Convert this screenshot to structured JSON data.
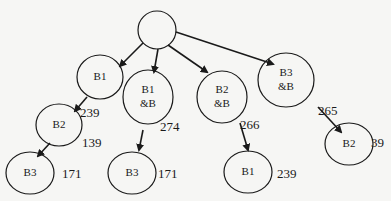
{
  "diagram": {
    "type": "tree",
    "colors": {
      "stroke": "#1a1a1a",
      "background": "#f6f6f4"
    },
    "nodes": [
      {
        "id": "root",
        "label": "",
        "cx": 157,
        "cy": 30,
        "rx": 19,
        "ry": 19
      },
      {
        "id": "b1",
        "label": "B1",
        "cx": 100,
        "cy": 77,
        "rx": 23,
        "ry": 22
      },
      {
        "id": "b1b",
        "label": "B1",
        "label2": "&B",
        "cx": 148,
        "cy": 97,
        "rx": 25,
        "ry": 27
      },
      {
        "id": "b2b",
        "label": "B2",
        "label2": "&B",
        "cx": 222,
        "cy": 97,
        "rx": 25,
        "ry": 26
      },
      {
        "id": "b3b",
        "label": "B3",
        "label2": "&B",
        "cx": 286,
        "cy": 80,
        "rx": 28,
        "ry": 27
      },
      {
        "id": "b2l",
        "label": "B2",
        "cx": 59,
        "cy": 125,
        "rx": 23,
        "ry": 21
      },
      {
        "id": "b3l",
        "label": "B3",
        "cx": 30,
        "cy": 173,
        "rx": 24,
        "ry": 21
      },
      {
        "id": "b3m",
        "label": "B3",
        "cx": 132,
        "cy": 173,
        "rx": 24,
        "ry": 21
      },
      {
        "id": "b1r",
        "label": "B1",
        "cx": 248,
        "cy": 172,
        "rx": 24,
        "ry": 21
      },
      {
        "id": "b2r",
        "label": "B2",
        "cx": 349,
        "cy": 144,
        "rx": 24,
        "ry": 21
      }
    ],
    "edges": [
      {
        "from": "root",
        "to": "b1",
        "x1": 143,
        "y1": 43,
        "x2": 120,
        "y2": 66
      },
      {
        "from": "root",
        "to": "b1b",
        "x1": 158,
        "y1": 49,
        "x2": 154,
        "y2": 72
      },
      {
        "from": "root",
        "to": "b2b",
        "x1": 168,
        "y1": 45,
        "x2": 207,
        "y2": 72
      },
      {
        "from": "root",
        "to": "b3b",
        "x1": 176,
        "y1": 32,
        "x2": 273,
        "y2": 64
      },
      {
        "from": "b1",
        "to": "b2l",
        "x1": 87,
        "y1": 97,
        "x2": 75,
        "y2": 111
      },
      {
        "from": "b2l",
        "to": "b3l",
        "x1": 50,
        "y1": 143,
        "x2": 38,
        "y2": 156
      },
      {
        "from": "b1b",
        "to": "b3m",
        "x1": 143,
        "y1": 130,
        "x2": 139,
        "y2": 150
      },
      {
        "from": "b2b",
        "to": "b1r",
        "x1": 240,
        "y1": 123,
        "x2": 248,
        "y2": 150
      },
      {
        "from": "b3b",
        "to": "b2r",
        "x1": 318,
        "y1": 107,
        "x2": 341,
        "y2": 132
      }
    ],
    "values": [
      {
        "text": "239",
        "x": 80,
        "y": 117
      },
      {
        "text": "139",
        "x": 82,
        "y": 147
      },
      {
        "text": "171",
        "x": 62,
        "y": 178
      },
      {
        "text": "274",
        "x": 160,
        "y": 131
      },
      {
        "text": "171",
        "x": 158,
        "y": 178
      },
      {
        "text": "266",
        "x": 240,
        "y": 129
      },
      {
        "text": "239",
        "x": 277,
        "y": 178
      },
      {
        "text": "265",
        "x": 318,
        "y": 115
      },
      {
        "text": "39",
        "x": 371,
        "y": 147
      }
    ]
  }
}
